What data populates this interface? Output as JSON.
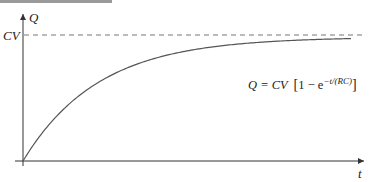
{
  "chart_data": {
    "type": "line",
    "title": "",
    "xlabel": "t",
    "ylabel": "Q",
    "asymptote_label": "CV",
    "formula": {
      "lhs": "Q = CV",
      "bracket_open": "[",
      "one_minus": "1 − e",
      "exponent": "−t/(RC)",
      "bracket_close": "]"
    },
    "series": [
      {
        "name": "Q(t)",
        "x": [
          0,
          0.5,
          1,
          1.5,
          2,
          3,
          4,
          5,
          6
        ],
        "values": [
          0,
          0.39,
          0.63,
          0.78,
          0.86,
          0.95,
          0.98,
          0.99,
          0.998
        ]
      }
    ],
    "asymptote": 1.0,
    "grid": false,
    "legend": "none",
    "colors": {
      "curve": "#555555",
      "axes": "#333333",
      "dash": "#777777"
    }
  }
}
